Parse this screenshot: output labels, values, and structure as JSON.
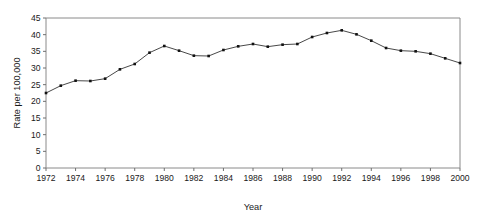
{
  "chart_data": {
    "type": "line",
    "title": "",
    "xlabel": "Year",
    "ylabel": "Rate per 100,000",
    "grid": false,
    "legend": false,
    "xlim": [
      1972,
      2000
    ],
    "ylim": [
      0,
      45
    ],
    "ytick_step": 5,
    "xtick_step": 2,
    "yticks": [
      0,
      5,
      10,
      15,
      20,
      25,
      30,
      35,
      40,
      45
    ],
    "ytick_labels": [
      "0",
      "5",
      "10",
      "15",
      "20",
      "25",
      "30",
      "35",
      "40",
      "45"
    ],
    "xticks": [
      1972,
      1974,
      1976,
      1978,
      1980,
      1982,
      1984,
      1986,
      1988,
      1990,
      1992,
      1994,
      1996,
      1998,
      2000
    ],
    "xtick_labels": [
      "1972",
      "1974",
      "1976",
      "1978",
      "1980",
      "1982",
      "1984",
      "1986",
      "1988",
      "1990",
      "1992",
      "1994",
      "1996",
      "1998",
      "2000"
    ],
    "x": [
      1972,
      1973,
      1974,
      1975,
      1976,
      1977,
      1978,
      1979,
      1980,
      1981,
      1982,
      1983,
      1984,
      1985,
      1986,
      1987,
      1988,
      1989,
      1990,
      1991,
      1992,
      1993,
      1994,
      1995,
      1996,
      1997,
      1998,
      1999,
      2000
    ],
    "values": [
      22.5,
      24.7,
      26.2,
      26.1,
      26.8,
      29.6,
      31.2,
      34.6,
      36.6,
      35.2,
      33.7,
      33.6,
      35.4,
      36.5,
      37.2,
      36.4,
      37.0,
      37.2,
      39.3,
      40.5,
      41.3,
      40.1,
      38.2,
      36.0,
      35.2,
      35.0,
      34.3,
      32.9,
      31.5
    ],
    "marker": "square",
    "line_color": "#333333",
    "marker_color": "#111111",
    "series_name": "Rate per 100,000"
  },
  "axes": {
    "x_title": "Year",
    "y_title": "Rate per 100,000"
  }
}
